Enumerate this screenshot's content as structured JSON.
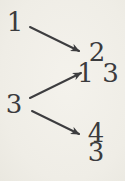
{
  "figure": {
    "type": "mapping-diagram",
    "colors": {
      "background": "#f1efe8",
      "ink": "#3b3b3d"
    },
    "left_nodes": [
      {
        "id": "left-1",
        "label": "1"
      },
      {
        "id": "left-3",
        "label": "3"
      }
    ],
    "right_nodes": [
      {
        "id": "right-2",
        "label": "2"
      },
      {
        "id": "right-1-3",
        "label": "1 3"
      },
      {
        "id": "right-4",
        "label": "4"
      },
      {
        "id": "right-3",
        "label": "3"
      }
    ],
    "edges": [
      {
        "from": "1",
        "to": "2"
      },
      {
        "from": "3",
        "to": "1 3"
      },
      {
        "from": "3",
        "to": "4"
      }
    ]
  }
}
